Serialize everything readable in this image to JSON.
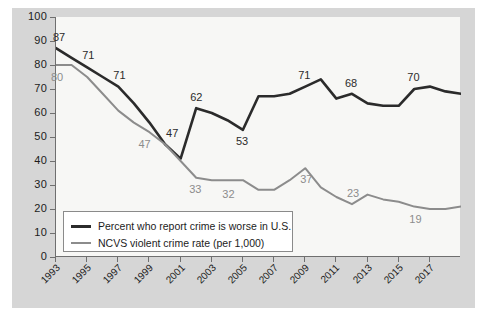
{
  "chart_data": {
    "type": "line",
    "title": "",
    "subtitle": "",
    "xlabel": "",
    "ylabel": "",
    "ylim": [
      0,
      100
    ],
    "ytick_values": [
      0,
      10,
      20,
      30,
      40,
      50,
      60,
      70,
      80,
      90,
      100
    ],
    "ytick_labels": [
      "0",
      "10",
      "20",
      "30",
      "40",
      "50",
      "60",
      "70",
      "80",
      "90",
      "100"
    ],
    "xlim": [
      1993,
      2019
    ],
    "xtick_labels": [
      "1993",
      "1995",
      "1997",
      "1999",
      "2001",
      "2003",
      "2005",
      "2007",
      "2009",
      "2011",
      "2013",
      "2015",
      "2017"
    ],
    "xtick_values": [
      1993,
      1995,
      1997,
      1999,
      2001,
      2003,
      2005,
      2007,
      2009,
      2011,
      2013,
      2015,
      2017
    ],
    "grid": false,
    "legend_position": "lower-left-inside",
    "series": [
      {
        "name": "Percent who report crime is worse in U.S.",
        "color": "#2b2b2b",
        "x": [
          1993,
          1994,
          1995,
          1996,
          1997,
          1998,
          1999,
          2000,
          2001,
          2002,
          2003,
          2004,
          2005,
          2006,
          2007,
          2008,
          2009,
          2010,
          2011,
          2012,
          2013,
          2014,
          2015,
          2016,
          2017,
          2018,
          2019
        ],
        "values": [
          87,
          83,
          79,
          75,
          71,
          64,
          56,
          47,
          41,
          62,
          60,
          57,
          53,
          67,
          67,
          68,
          71,
          74,
          66,
          68,
          64,
          63,
          63,
          70,
          71,
          69,
          68
        ],
        "labels": [
          {
            "x": 1993,
            "value": 87,
            "text": "87"
          },
          {
            "x": 1995,
            "value": 79,
            "text": "71"
          },
          {
            "x": 1997,
            "value": 71,
            "text": "71"
          },
          {
            "x": 2000,
            "value": 47,
            "text": "47"
          },
          {
            "x": 2002,
            "value": 62,
            "text": "62"
          },
          {
            "x": 2005,
            "value": 53,
            "text": "53"
          },
          {
            "x": 2009,
            "value": 71,
            "text": "71"
          },
          {
            "x": 2012,
            "value": 68,
            "text": "68"
          },
          {
            "x": 2016,
            "value": 70,
            "text": "70"
          }
        ]
      },
      {
        "name": "NCVS violent crime rate (per 1,000)",
        "color": "#8c8c8c",
        "x": [
          1993,
          1994,
          1995,
          1996,
          1997,
          1998,
          1999,
          2000,
          2001,
          2002,
          2003,
          2004,
          2005,
          2006,
          2007,
          2008,
          2009,
          2010,
          2011,
          2012,
          2013,
          2014,
          2015,
          2016,
          2017,
          2018,
          2019
        ],
        "values": [
          80,
          80,
          75,
          68,
          61,
          56,
          52,
          47,
          40,
          33,
          32,
          32,
          32,
          28,
          28,
          32,
          37,
          29,
          25,
          22,
          26,
          24,
          23,
          21,
          20,
          20,
          21
        ],
        "labels": [
          {
            "x": 1993,
            "value": 80,
            "text": "80"
          },
          {
            "x": 1999,
            "value": 52,
            "text": "47"
          },
          {
            "x": 2002,
            "value": 33,
            "text": "33"
          },
          {
            "x": 2004,
            "value": 32,
            "text": "32"
          },
          {
            "x": 2009,
            "value": 37,
            "text": "37"
          },
          {
            "x": 2012,
            "value": 22,
            "text": "23"
          },
          {
            "x": 2016,
            "value": 21,
            "text": "19"
          }
        ]
      }
    ]
  },
  "legend": {
    "items": [
      {
        "label": "Percent who report crime is worse in U.S.",
        "style": "dark"
      },
      {
        "label": "NCVS violent crime rate (per 1,000)",
        "style": "gray"
      }
    ]
  },
  "colors": {
    "dark_series": "#2b2b2b",
    "gray_series": "#8c8c8c",
    "panel_background": "#d6d6d6",
    "plot_background": "#f7f7f5",
    "axis": "#6f6f6f"
  }
}
